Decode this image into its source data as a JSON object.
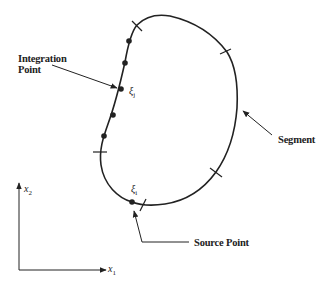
{
  "figure": {
    "labels": {
      "integration_point_line1": "Integration",
      "integration_point_line2": "Point",
      "segment": "Segment",
      "source_point": "Source Point"
    },
    "symbols": {
      "xi_j": "ξ",
      "xi_j_sub": "j",
      "xi_i": "ξ",
      "xi_i_sub": "i"
    },
    "axes": {
      "x_label": "x",
      "x_sub": "1",
      "y_label": "x",
      "y_sub": "2"
    },
    "colors": {
      "ink": "#222222",
      "background": "#ffffff"
    }
  }
}
